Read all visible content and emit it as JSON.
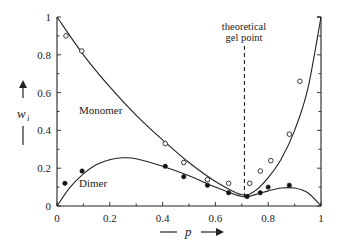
{
  "chart_data": {
    "type": "line",
    "title": "",
    "xlabel": "p",
    "ylabel": "w_i",
    "xlim": [
      0,
      1
    ],
    "ylim": [
      0,
      1
    ],
    "xticks": [
      "0",
      "0.2",
      "0.4",
      "0.6",
      "0.8",
      "1"
    ],
    "yticks": [
      "0",
      "0.2",
      "0.4",
      "0.6",
      "0.8",
      "1"
    ],
    "grid": false,
    "annotations": [
      {
        "text": "theoretical gel point",
        "x": 0.71,
        "style": "dashed vertical line"
      }
    ],
    "series": [
      {
        "name": "Monomer",
        "kind": "theory-curve",
        "x": [
          0,
          0.1,
          0.2,
          0.3,
          0.4,
          0.5,
          0.6,
          0.7,
          0.75,
          0.8,
          0.85,
          0.9,
          0.95,
          1.0
        ],
        "y": [
          1.0,
          0.8,
          0.63,
          0.48,
          0.35,
          0.23,
          0.13,
          0.06,
          0.08,
          0.15,
          0.25,
          0.4,
          0.62,
          1.0
        ]
      },
      {
        "name": "Dimer",
        "kind": "theory-curve",
        "x": [
          0,
          0.05,
          0.1,
          0.15,
          0.2,
          0.25,
          0.3,
          0.4,
          0.5,
          0.6,
          0.7,
          0.75,
          0.8,
          0.85,
          0.9,
          0.95,
          1.0
        ],
        "y": [
          0,
          0.1,
          0.17,
          0.22,
          0.245,
          0.255,
          0.25,
          0.21,
          0.16,
          0.1,
          0.05,
          0.06,
          0.08,
          0.095,
          0.095,
          0.07,
          0
        ]
      },
      {
        "name": "Monomer (experimental)",
        "kind": "open-circles",
        "x": [
          0.034,
          0.094,
          0.41,
          0.48,
          0.57,
          0.65,
          0.73,
          0.77,
          0.81,
          0.88,
          0.92
        ],
        "y": [
          0.9,
          0.82,
          0.33,
          0.23,
          0.14,
          0.12,
          0.12,
          0.185,
          0.24,
          0.38,
          0.66
        ]
      },
      {
        "name": "Dimer (experimental)",
        "kind": "filled-circles",
        "x": [
          0.03,
          0.095,
          0.41,
          0.48,
          0.57,
          0.65,
          0.72,
          0.77,
          0.8,
          0.88
        ],
        "y": [
          0.12,
          0.185,
          0.21,
          0.155,
          0.11,
          0.07,
          0.05,
          0.07,
          0.1,
          0.11
        ]
      }
    ]
  },
  "labels": {
    "monomer": "Monomer",
    "dimer": "Dimer",
    "gel_line1": "theoretical",
    "gel_line2": "gel point",
    "xlabel": "p",
    "ylabel_main": "w",
    "ylabel_sub": "i"
  }
}
